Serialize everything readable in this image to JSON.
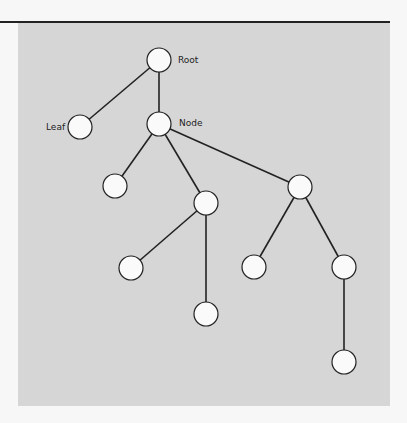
{
  "diagram": {
    "type": "tree",
    "colors": {
      "panel": "#d6d6d6",
      "node_fill": "#fafafa",
      "stroke": "#222222",
      "rule": "#222222"
    },
    "node_radius": 12,
    "nodes": [
      {
        "id": "root",
        "x": 159,
        "y": 60,
        "label": "Root"
      },
      {
        "id": "leaf",
        "x": 80,
        "y": 127,
        "label": "Leaf"
      },
      {
        "id": "node",
        "x": 159,
        "y": 124,
        "label": "Node"
      },
      {
        "id": "a",
        "x": 115,
        "y": 186,
        "label": ""
      },
      {
        "id": "b",
        "x": 206,
        "y": 203,
        "label": ""
      },
      {
        "id": "c",
        "x": 300,
        "y": 187,
        "label": ""
      },
      {
        "id": "b1",
        "x": 131,
        "y": 268,
        "label": ""
      },
      {
        "id": "b2",
        "x": 206,
        "y": 314,
        "label": ""
      },
      {
        "id": "c1",
        "x": 254,
        "y": 267,
        "label": ""
      },
      {
        "id": "c2",
        "x": 344,
        "y": 267,
        "label": ""
      },
      {
        "id": "c2a",
        "x": 344,
        "y": 362,
        "label": ""
      }
    ],
    "edges": [
      [
        "root",
        "leaf"
      ],
      [
        "root",
        "node"
      ],
      [
        "node",
        "a"
      ],
      [
        "node",
        "b"
      ],
      [
        "node",
        "c"
      ],
      [
        "b",
        "b1"
      ],
      [
        "b",
        "b2"
      ],
      [
        "c",
        "c1"
      ],
      [
        "c",
        "c2"
      ],
      [
        "c2",
        "c2a"
      ]
    ],
    "labels": {
      "root": {
        "text": "Root",
        "x": 178,
        "y": 63
      },
      "leaf": {
        "text": "Leaf",
        "x": 46,
        "y": 130
      },
      "node": {
        "text": "Node",
        "x": 179,
        "y": 126
      }
    }
  }
}
